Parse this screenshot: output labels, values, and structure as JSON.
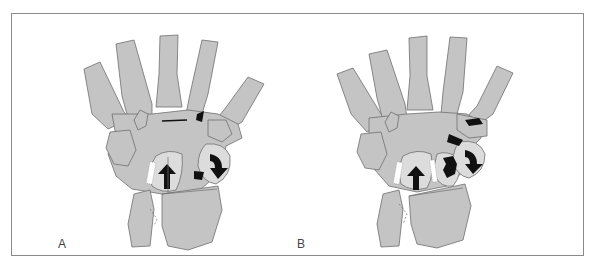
{
  "figure": {
    "panels": [
      {
        "id": "A",
        "label": "A",
        "description": "Dorsal view of wrist and hand bones with rotation arrows on two carpal bones"
      },
      {
        "id": "B",
        "label": "B",
        "description": "Dorsal view of wrist with fractured carpal bone (dark region) and rotation arrows"
      }
    ]
  },
  "colors": {
    "bone_fill": "#c4c4c4",
    "bone_highlight": "#dcdcdc",
    "outline": "#6e6e6e",
    "dark_marks": "#111111",
    "frame_border": "#8a8a8a",
    "background": "#ffffff"
  }
}
